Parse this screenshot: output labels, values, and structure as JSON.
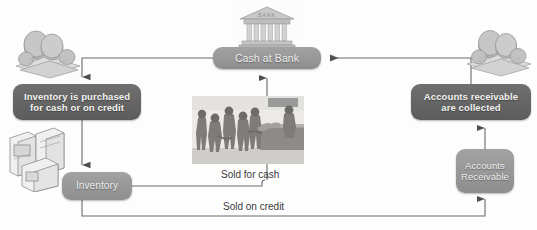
{
  "diagram": {
    "colors": {
      "node_dark": "#656565",
      "node_mid": "#989898",
      "node_text": "#f2f2f0",
      "wire": "#6a6a6a",
      "caption_text": "#3b3b3b",
      "background": "#fdfdfd"
    },
    "nodes": [
      {
        "id": "cash-at-bank",
        "label": "Cash at Bank",
        "lines": [
          "Cash at Bank"
        ],
        "style": "mid"
      },
      {
        "id": "inventory-purchased",
        "label": "Inventory is purchased for cash or on credit",
        "lines": [
          "Inventory is purchased",
          "for cash or on credit"
        ],
        "style": "dark"
      },
      {
        "id": "accounts-receivable-collected",
        "label": "Accounts receivable are collected",
        "lines": [
          "Accounts receivable",
          "are collected"
        ],
        "style": "dark"
      },
      {
        "id": "inventory",
        "label": "Inventory",
        "lines": [
          "Inventory"
        ],
        "style": "mid"
      },
      {
        "id": "accounts-receivable",
        "label": "Accounts Receivable",
        "lines": [
          "Accounts",
          "Receivable"
        ],
        "style": "mid"
      }
    ],
    "captions": [
      {
        "id": "sold-for-cash",
        "text": "Sold for cash"
      },
      {
        "id": "sold-on-credit",
        "text": "Sold on credit"
      }
    ],
    "illustrations": [
      {
        "id": "bank-building",
        "name": "bank-building-illustration",
        "pediment_text": "BANK"
      },
      {
        "id": "money-left",
        "name": "coins-and-banknotes-illustration"
      },
      {
        "id": "money-right",
        "name": "coins-and-banknotes-illustration"
      },
      {
        "id": "inventory-goods",
        "name": "appliance-boxes-illustration"
      },
      {
        "id": "shoppers",
        "name": "customers-at-checkout-photo"
      }
    ],
    "connectors": [
      {
        "id": "cash-to-inventory-purchased",
        "from": "cash-at-bank",
        "to": "inventory-purchased",
        "arrow": "down"
      },
      {
        "id": "inventory-purchased-to-inventory",
        "from": "inventory-purchased",
        "to": "inventory",
        "arrow": "down"
      },
      {
        "id": "inventory-to-sold-for-cash",
        "from": "inventory",
        "to": "cash-at-bank",
        "arrow": "up"
      },
      {
        "id": "inventory-to-sold-on-credit",
        "from": "inventory",
        "to": "accounts-receivable",
        "arrow": "up"
      },
      {
        "id": "accounts-receivable-to-collected",
        "from": "accounts-receivable",
        "to": "accounts-receivable-collected",
        "arrow": "up"
      },
      {
        "id": "collected-to-cash",
        "from": "accounts-receivable-collected",
        "to": "cash-at-bank",
        "arrow": "left"
      }
    ]
  }
}
